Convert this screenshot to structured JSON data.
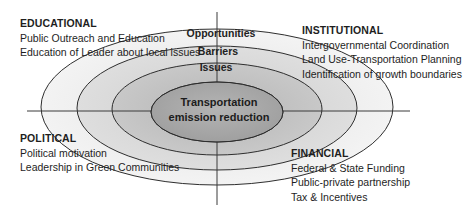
{
  "diagram": {
    "center": {
      "x": 217,
      "y": 111
    },
    "axes": {
      "horizontal": {
        "x1": 27,
        "x2": 410,
        "y": 111,
        "color": "#3a3a3a"
      },
      "vertical": {
        "x": 217,
        "y1": 12,
        "y2": 205,
        "color": "#3a3a3a"
      }
    },
    "rings": [
      {
        "name": "opportunities",
        "label": "Opportunities",
        "rx": 176,
        "ry": 78,
        "fill": "#ededed",
        "stroke": "#2e2e2e",
        "label_y": 33
      },
      {
        "name": "barriers",
        "label": "Barriers",
        "rx": 140,
        "ry": 62,
        "fill": "#d9d9d9",
        "stroke": "#2e2e2e",
        "label_y": 52
      },
      {
        "name": "issues",
        "label": "Issues",
        "rx": 105,
        "ry": 47,
        "fill": "#c3c3c3",
        "stroke": "#2e2e2e",
        "label_y": 71
      },
      {
        "name": "core",
        "label": "",
        "rx": 66,
        "ry": 30,
        "fill": "#a9a9a9",
        "stroke": "#2e2e2e",
        "label_y": 0
      }
    ],
    "core": {
      "line1": "Transportation",
      "line2": "emission reduction"
    }
  },
  "quadrants": {
    "educational": {
      "heading": "EDUCATIONAL",
      "items": [
        "Public Outreach and Education",
        "Education of Leader about local issues"
      ]
    },
    "institutional": {
      "heading": "INSTITUTIONAL",
      "items": [
        "Intergovernmental Coordination",
        "Land Use-Transportation Planning",
        "Identification of growth boundaries"
      ]
    },
    "political": {
      "heading": "POLITICAL",
      "items": [
        "Political motivation",
        "Leadership in Green Communities"
      ]
    },
    "financial": {
      "heading": "FINANCIAL",
      "items": [
        "Federal & State Funding",
        "Public-private partnership",
        "Tax & Incentives"
      ]
    }
  }
}
